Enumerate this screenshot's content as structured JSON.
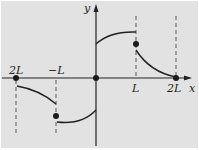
{
  "diagram": {
    "type": "piecewise-function-plot",
    "axes": {
      "x_label": "x",
      "y_label": "y"
    },
    "tick_labels": {
      "neg_2L": "2L",
      "neg_L": "−L",
      "pos_L": "L",
      "pos_2L": "2L"
    },
    "colors": {
      "background": "#e2e2e2",
      "line": "#222222",
      "dashed": "#555555"
    },
    "points": [
      {
        "name": "point-neg-2L",
        "x": "-2L",
        "y": 0
      },
      {
        "name": "point-neg-L",
        "x": "-L",
        "y": "midpoint"
      },
      {
        "name": "point-origin",
        "x": 0,
        "y": 0
      },
      {
        "name": "point-L",
        "x": "L",
        "y": "midpoint"
      },
      {
        "name": "point-2L",
        "x": "2L",
        "y": 0
      }
    ],
    "segments": [
      {
        "name": "segment-neg2L-to-negL",
        "interval": "(-2L, -L)",
        "shape": "decreasing, below axis"
      },
      {
        "name": "segment-negL-to-0",
        "interval": "(-L, 0)",
        "shape": "increasing, below axis"
      },
      {
        "name": "segment-0-to-L",
        "interval": "(0, L)",
        "shape": "increasing, above axis"
      },
      {
        "name": "segment-L-to-2L",
        "interval": "(L, 2L)",
        "shape": "decreasing, above axis"
      }
    ]
  }
}
